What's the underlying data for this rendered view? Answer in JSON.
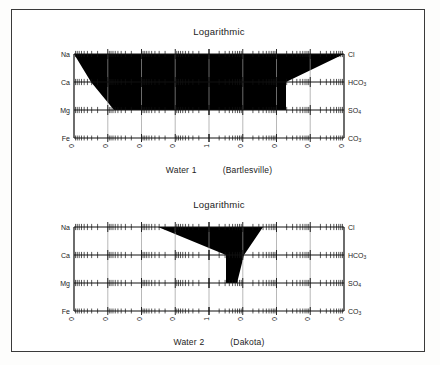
{
  "figure": {
    "border_color": "#3a3a3a",
    "background": "#ffffff",
    "ink": "#000000"
  },
  "panels": [
    {
      "id": "water-1",
      "title": "Logarithmic",
      "caption_name": "Water 1",
      "caption_place": "(Bartlesville)",
      "cations": [
        "Na",
        "Ca",
        "Mg",
        "Fe"
      ],
      "anions": [
        "Cl",
        "HCO3",
        "SO4",
        "CO3"
      ],
      "x_ticks_left": [
        "10,000",
        "1,000",
        "100",
        "10"
      ],
      "x_ticks_center": "1",
      "x_ticks_right": [
        "10",
        "100",
        "1,000",
        "10,000"
      ]
    },
    {
      "id": "water-2",
      "title": "Logarithmic",
      "caption_name": "Water 2",
      "caption_place": "(Dakota)",
      "cations": [
        "Na",
        "Ca",
        "Mg",
        "Fe"
      ],
      "anions": [
        "Cl",
        "HCO3",
        "SO4",
        "CO3"
      ],
      "x_ticks_left": [
        "10,000",
        "1,000",
        "100",
        "10"
      ],
      "x_ticks_center": "1",
      "x_ticks_right": [
        "10",
        "100",
        "1,000",
        "10,000"
      ]
    }
  ],
  "chart_data": {
    "type": "line",
    "chart_kind": "stiff-diagram-logarithmic",
    "title": "Logarithmic",
    "xlabel": "",
    "ylabel": "",
    "axis_scale": "log, mirrored about center value 1",
    "x_decades_left": [
      10000,
      1000,
      100,
      10,
      1
    ],
    "x_decades_right": [
      1,
      10,
      100,
      1000,
      10000
    ],
    "grid": true,
    "legend": "none",
    "rows": [
      {
        "cation": "Na",
        "anion": "Cl"
      },
      {
        "cation": "Ca",
        "anion": "HCO3"
      },
      {
        "cation": "Mg",
        "anion": "SO4"
      },
      {
        "cation": "Fe",
        "anion": "CO3"
      }
    ],
    "series": [
      {
        "name": "Water 1 (Bartlesville)",
        "cations": [
          {
            "ion": "Na",
            "value": 4000
          },
          {
            "ion": "Ca",
            "value": 700
          },
          {
            "ion": "Mg",
            "value": 150
          },
          {
            "ion": "Fe",
            "value": 1
          }
        ],
        "anions": [
          {
            "ion": "Cl",
            "value": 6000
          },
          {
            "ion": "HCO3",
            "value": 1
          },
          {
            "ion": "SO4",
            "value": 1
          },
          {
            "ion": "CO3",
            "value": 1
          }
        ]
      },
      {
        "name": "Water 2 (Dakota)",
        "cations": [
          {
            "ion": "Na",
            "value": 500
          },
          {
            "ion": "Ca",
            "value": 2
          },
          {
            "ion": "Mg",
            "value": 1
          },
          {
            "ion": "Fe",
            "value": 1
          }
        ],
        "anions": [
          {
            "ion": "Cl",
            "value": 200
          },
          {
            "ion": "HCO3",
            "value": 40
          },
          {
            "ion": "SO4",
            "value": 6
          },
          {
            "ion": "CO3",
            "value": 1
          }
        ]
      }
    ]
  }
}
